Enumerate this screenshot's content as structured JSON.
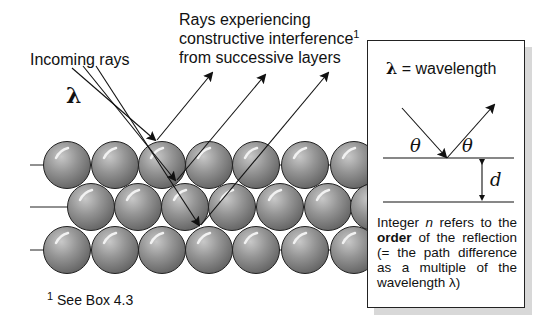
{
  "labels": {
    "incoming_rays": "Incoming rays",
    "lambda_symbol": "λ",
    "reflected_line1": "Rays experiencing",
    "reflected_line2": "constructive interference",
    "reflected_sup": "1",
    "reflected_line3": "from successive layers",
    "footnote_sup": "1",
    "footnote_text": "See Box 4.3"
  },
  "box": {
    "title_symbol": "λ",
    "title_text": "= wavelength",
    "theta_left": "θ",
    "theta_right": "θ",
    "spacing_label": "d",
    "note_part1": "Integer ",
    "note_var": "n",
    "note_part2": " refers to the ",
    "note_bold": "order",
    "note_part3": " of the reflection (= the path difference as a multiple of the wavelength λ)"
  },
  "colors": {
    "sphere_fill": "#8c8c8c",
    "sphere_highlight": "#e8e8e8",
    "line": "#1a1a1a",
    "box_shadow": "#d8d8d8"
  },
  "lattice": {
    "rows": 3,
    "layer_lines_y": [
      165,
      207,
      250
    ]
  }
}
